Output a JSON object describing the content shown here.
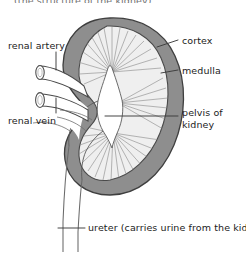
{
  "figure": {
    "width": 246,
    "height": 258,
    "background": "#ffffff",
    "cut_off_header_text": "(the structure of the kidney)"
  },
  "colors": {
    "outline": "#4a4a4a",
    "cortex_fill": "#8e8e8e",
    "medulla_fill": "#efefef",
    "pelvis_fill": "#ffffff",
    "striation": "#8a8a8a",
    "vessel_fill": "#ffffff",
    "leader_line": "#3c3c3c",
    "text": "#1b1b1b"
  },
  "labels": {
    "renal_artery": "renal artery",
    "renal_vein": "renal vein",
    "cortex": "cortex",
    "medulla": "medulla",
    "pelvis_line1": "pelvis of",
    "pelvis_line2": "kidney",
    "ureter": "ureter (carries urine from the kidney)"
  },
  "structures": [
    {
      "name": "cortex",
      "description": "dark grey outer band of the kidney"
    },
    {
      "name": "medulla",
      "description": "light grey striated inner zone with radiating pyramids"
    },
    {
      "name": "pelvis-of-kidney",
      "description": "white funnel-shaped central cavity"
    },
    {
      "name": "renal-artery",
      "description": "upper cut tube entering the hilum"
    },
    {
      "name": "renal-vein",
      "description": "lower cut tube entering the hilum"
    },
    {
      "name": "ureter",
      "description": "tube descending from the pelvis to the bottom of the figure"
    }
  ]
}
